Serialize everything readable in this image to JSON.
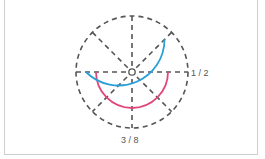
{
  "diagram": {
    "type": "fraction-circle",
    "divisions": 8,
    "labels": {
      "right": "1 / 2",
      "bottom": "3 / 8"
    },
    "arcs": [
      {
        "name": "half-arc",
        "fraction": "1/2",
        "color": "#e0457b"
      },
      {
        "name": "three-eighths-arc",
        "fraction": "3/8",
        "color": "#2a9fd8"
      }
    ],
    "colors": {
      "dashed": "#555555",
      "frame": "#cfcfcf"
    }
  }
}
